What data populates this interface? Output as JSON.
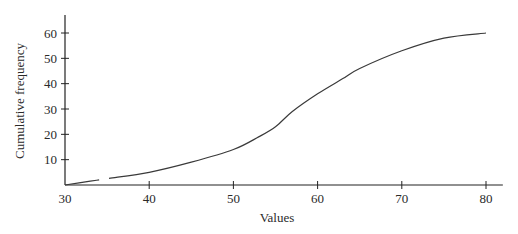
{
  "chart_data": {
    "type": "line",
    "title": "",
    "xlabel": "Values",
    "ylabel": "Cumulative frequency",
    "xlim": [
      30,
      82
    ],
    "ylim": [
      0,
      66
    ],
    "x_ticks": [
      30,
      40,
      50,
      60,
      70,
      80
    ],
    "y_ticks": [
      10,
      20,
      30,
      40,
      50,
      60
    ],
    "grid": false,
    "legend": null,
    "series": [
      {
        "name": "Cumulative frequency",
        "x": [
          30,
          33,
          35,
          40,
          45,
          50,
          53,
          55,
          57,
          60,
          63,
          65,
          70,
          75,
          80
        ],
        "y": [
          0,
          1.5,
          2.5,
          5,
          9,
          14,
          19,
          23,
          29,
          36,
          42,
          46,
          53,
          58,
          60
        ]
      }
    ],
    "gap_in_curve": [
      34,
      35.2
    ]
  },
  "colors": {
    "line": "#3a3a3a",
    "axis": "#222222"
  }
}
